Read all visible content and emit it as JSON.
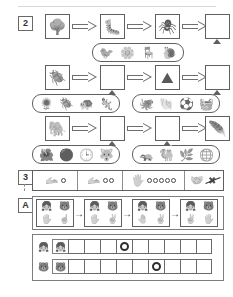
{
  "page": {
    "top_rule": true
  },
  "section2": {
    "label": "2",
    "rows": [
      {
        "name": "food-chain-row-1",
        "sequence": [
          {
            "type": "image",
            "icon": "tree",
            "glyph": "🌳"
          },
          {
            "type": "arrow"
          },
          {
            "type": "image",
            "icon": "caterpillar",
            "glyph": "🐛"
          },
          {
            "type": "arrow"
          },
          {
            "type": "image",
            "icon": "spider",
            "glyph": "🕷"
          },
          {
            "type": "arrow"
          },
          {
            "type": "blank"
          }
        ],
        "option_groups": [
          {
            "name": "options-row1",
            "attached_to_blank_index": 6,
            "options": [
              {
                "icon": "bird",
                "glyph": "🐦"
              },
              {
                "icon": "flower",
                "glyph": "🌼"
              },
              {
                "icon": "chair",
                "glyph": "🪑"
              },
              {
                "icon": "snail",
                "glyph": "🐌"
              }
            ]
          }
        ]
      },
      {
        "name": "food-chain-row-2",
        "sequence": [
          {
            "type": "image",
            "icon": "beetle",
            "glyph": "🪲"
          },
          {
            "type": "arrow"
          },
          {
            "type": "blank"
          },
          {
            "type": "arrow"
          },
          {
            "type": "image",
            "icon": "mountain",
            "glyph": "⛰"
          },
          {
            "type": "arrow"
          },
          {
            "type": "blank"
          }
        ],
        "option_groups": [
          {
            "name": "options-row2-left",
            "attached_to_blank_index": 2,
            "options": [
              {
                "icon": "sunflower",
                "glyph": "🌻"
              },
              {
                "icon": "beetle-black",
                "glyph": "🪲"
              },
              {
                "icon": "turtle",
                "glyph": "🐢"
              },
              {
                "icon": "lizard",
                "glyph": "🦎"
              }
            ]
          },
          {
            "name": "options-row2-right",
            "attached_to_blank_index": 6,
            "options": [
              {
                "icon": "octopus",
                "glyph": "🐙"
              },
              {
                "icon": "shell",
                "glyph": "🐚"
              },
              {
                "icon": "ball",
                "glyph": "⚽"
              },
              {
                "icon": "basket",
                "glyph": "🧺"
              }
            ]
          }
        ]
      },
      {
        "name": "food-chain-row-3",
        "sequence": [
          {
            "type": "image",
            "icon": "elephant",
            "glyph": "🐘"
          },
          {
            "type": "arrow"
          },
          {
            "type": "blank"
          },
          {
            "type": "arrow"
          },
          {
            "type": "blank"
          },
          {
            "type": "arrow"
          },
          {
            "type": "image",
            "icon": "feather",
            "glyph": "🪶"
          }
        ],
        "option_groups": [
          {
            "name": "options-row3-left",
            "attached_to_blank_index": 2,
            "options": [
              {
                "icon": "flower",
                "glyph": "🌺"
              },
              {
                "icon": "sphere",
                "glyph": "⚫"
              },
              {
                "icon": "clock",
                "glyph": "🕒"
              },
              {
                "icon": "wolf",
                "glyph": "🐺"
              }
            ]
          },
          {
            "name": "options-row3-right",
            "attached_to_blank_index": 4,
            "options": [
              {
                "icon": "armadillo",
                "glyph": "🦡"
              },
              {
                "icon": "camel",
                "glyph": "🐫"
              },
              {
                "icon": "grass",
                "glyph": "🌿"
              },
              {
                "icon": "globe",
                "glyph": "🌐"
              }
            ]
          }
        ]
      }
    ]
  },
  "section3": {
    "label": "3",
    "cells": [
      {
        "name": "count-cell-1",
        "icon": "hand",
        "glyph": "🫴",
        "dots": 1,
        "crossed": false,
        "width": 45
      },
      {
        "name": "count-cell-2",
        "icon": "hand",
        "glyph": "🫴",
        "dots": 2,
        "crossed": false,
        "width": 45
      },
      {
        "name": "count-cell-3",
        "icon": "hand",
        "glyph": "🖐",
        "dots": 5,
        "crossed": false,
        "width": 62
      },
      {
        "name": "count-cell-4",
        "icon": "hands-crossed",
        "glyph": "🤝",
        "dots": 0,
        "crossed": true,
        "width": 38
      }
    ]
  },
  "sectionA": {
    "label": "A",
    "panels": [
      {
        "name": "panel-1",
        "top": [
          {
            "icon": "girl-face",
            "glyph": "👧"
          },
          {
            "icon": "bear-face",
            "glyph": "🐻"
          }
        ],
        "bottom": [
          {
            "icon": "hand-five",
            "glyph": "🖐"
          },
          {
            "icon": "hand-one",
            "glyph": "☝"
          }
        ]
      },
      {
        "name": "panel-2",
        "top": [
          {
            "icon": "girl-face",
            "glyph": "👧"
          },
          {
            "icon": "bear-face",
            "glyph": "🐻"
          }
        ],
        "bottom": [
          {
            "icon": "hand-four",
            "glyph": "🖐"
          },
          {
            "icon": "hand-two",
            "glyph": "✌"
          }
        ]
      },
      {
        "name": "panel-3",
        "top": [
          {
            "icon": "girl-face",
            "glyph": "👧"
          },
          {
            "icon": "bear-face",
            "glyph": "🐻"
          }
        ],
        "bottom": [
          {
            "icon": "hand-three",
            "glyph": "🤚"
          },
          {
            "icon": "hand-three",
            "glyph": "✌"
          }
        ]
      },
      {
        "name": "panel-4",
        "top": [
          {
            "icon": "girl-face",
            "glyph": "👧"
          },
          {
            "icon": "bear-face",
            "glyph": "🐻"
          }
        ],
        "bottom": [
          {
            "icon": "hand-two",
            "glyph": "✌"
          },
          {
            "icon": "hand-four",
            "glyph": "🖐"
          }
        ]
      }
    ],
    "arrow_glyph": "→"
  },
  "bottom_table": {
    "rows": [
      {
        "name": "table-row-girl",
        "legend_icon": "girl-face",
        "legend_glyph": "👧",
        "head_icon": "girl-face",
        "head_glyph": "👧",
        "cells": 9,
        "marked_index": 3
      },
      {
        "name": "table-row-bear",
        "legend_icon": "bear-face",
        "legend_glyph": "🐻",
        "head_icon": "bear-face",
        "head_glyph": "🐻",
        "cells": 9,
        "marked_index": 5
      }
    ]
  }
}
